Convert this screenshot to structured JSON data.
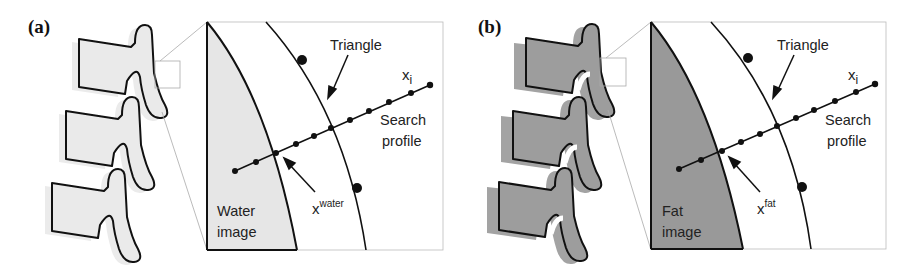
{
  "figure": {
    "panels": [
      {
        "id": "a",
        "label": "(a)",
        "image_label_line1": "Water",
        "image_label_line2": "image",
        "triangle_label": "Triangle",
        "xi_label": "x",
        "xi_sub": "i",
        "search_label_line1": "Search",
        "search_label_line2": "profile",
        "x_label": "x",
        "x_sup": "water",
        "fill_color": "#e6e6e6",
        "vertebra_fill": "#ececec"
      },
      {
        "id": "b",
        "label": "(b)",
        "image_label_line1": "Fat",
        "image_label_line2": "image",
        "triangle_label": "Triangle",
        "xi_label": "x",
        "xi_sub": "i",
        "search_label_line1": "Search",
        "search_label_line2": "profile",
        "x_label": "x",
        "x_sup": "fat",
        "fill_color": "#999999",
        "vertebra_fill": "#a0a0a0"
      }
    ]
  }
}
